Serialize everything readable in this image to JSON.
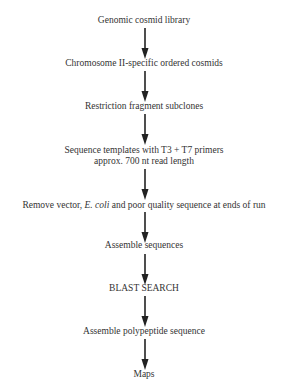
{
  "diagram": {
    "type": "flowchart",
    "direction": "top-to-bottom",
    "nodes": [
      {
        "id": "n1",
        "lines": [
          "Genomic cosmid library"
        ]
      },
      {
        "id": "n2",
        "lines": [
          "Chromosome II-specific ordered cosmids"
        ]
      },
      {
        "id": "n3",
        "lines": [
          "Restriction fragment subclones"
        ]
      },
      {
        "id": "n4",
        "lines": [
          "Sequence templates with T3 + T7 primers",
          "approx. 700 nt read length"
        ]
      },
      {
        "id": "n5",
        "lines": [
          "Remove vector, ",
          "E. coli",
          " and poor quality sequence at ends of run"
        ]
      },
      {
        "id": "n6",
        "lines": [
          "Assemble sequences"
        ]
      },
      {
        "id": "n7",
        "lines": [
          "BLAST SEARCH"
        ]
      },
      {
        "id": "n8",
        "lines": [
          "Assemble polypeptide sequence"
        ]
      },
      {
        "id": "n9",
        "lines": [
          "Maps"
        ]
      }
    ],
    "edges": [
      {
        "from": "n1",
        "to": "n2"
      },
      {
        "from": "n2",
        "to": "n3"
      },
      {
        "from": "n3",
        "to": "n4"
      },
      {
        "from": "n4",
        "to": "n5"
      },
      {
        "from": "n5",
        "to": "n6"
      },
      {
        "from": "n6",
        "to": "n7"
      },
      {
        "from": "n7",
        "to": "n8"
      },
      {
        "from": "n8",
        "to": "n9"
      }
    ],
    "colors": {
      "text": "#333333",
      "arrow": "#222222",
      "background": "#ffffff"
    }
  }
}
